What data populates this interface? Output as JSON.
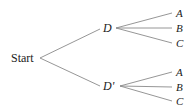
{
  "diagram": {
    "type": "tree",
    "root": {
      "label": "Start"
    },
    "level1": [
      {
        "label": "D",
        "children": [
          "A",
          "B",
          "C"
        ]
      },
      {
        "label": "D'",
        "children": [
          "A",
          "B",
          "C"
        ]
      }
    ],
    "colors": {
      "line": "#8a8a8a",
      "text": "#222222",
      "background": "#ffffff"
    }
  }
}
